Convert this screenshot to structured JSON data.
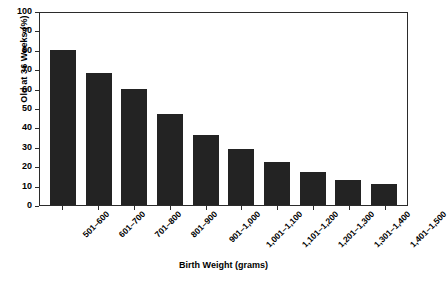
{
  "chart_data": {
    "type": "bar",
    "title": "",
    "xlabel": "Birth Weight (grams)",
    "ylabel": "Old at 36 Weeks (%)",
    "ylim": [
      0,
      100
    ],
    "yticks": [
      0,
      10,
      20,
      30,
      40,
      50,
      60,
      70,
      80,
      90,
      100
    ],
    "grid": false,
    "legend": "none",
    "bar_color": "#232323",
    "axis_color": "#2b2b2b",
    "categories": [
      "501–600",
      "601–700",
      "701–800",
      "801–900",
      "901–1,000",
      "1,001–1,100",
      "1,101–1,200",
      "1,201–1,300",
      "1,301–1,400",
      "1,401–1,500"
    ],
    "values": [
      80,
      68,
      60,
      47,
      36,
      29,
      22,
      17,
      13,
      11
    ]
  }
}
